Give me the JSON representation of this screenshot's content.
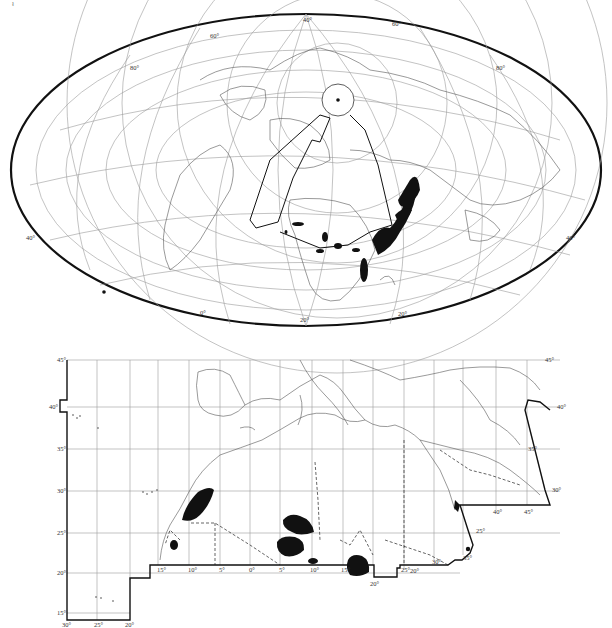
{
  "figure": {
    "corner_mark": "ł"
  },
  "world_map": {
    "projection": "oblique Mollweide / equal-area ellipse",
    "outline_color": "#111111",
    "graticule_color": "#9a9a9a",
    "graticule_labels": [
      "40°",
      "60°",
      "80°",
      "80°",
      "60°",
      "40°",
      "20°",
      "0°",
      "20°",
      "40°"
    ]
  },
  "regional_map": {
    "latitude_labels_left": [
      "45°",
      "40°",
      "35°",
      "30°",
      "25°",
      "20°",
      "15°"
    ],
    "latitude_labels_right": [
      "45°",
      "40°",
      "35°",
      "30°",
      "25°",
      "20°"
    ],
    "longitude_labels_bottom": [
      "30°",
      "25°",
      "20°"
    ],
    "longitude_labels_inner": [
      "15°",
      "10°",
      "5°",
      "0°",
      "5°",
      "10°",
      "15°",
      "20°",
      "25°",
      "30°",
      "35°",
      "40°",
      "45°"
    ],
    "extra_labels": [
      "20°",
      "25°",
      "35°",
      "30°",
      "25°"
    ],
    "feature_color": "#111111"
  }
}
